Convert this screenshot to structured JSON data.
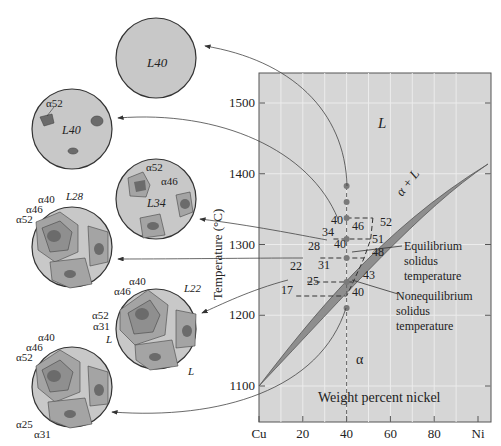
{
  "chart_data": {
    "type": "phase_diagram",
    "title": "",
    "xlabel": "Weight percent nickel",
    "ylabel": "Temperature (°C)",
    "x_ticks": [
      "Cu",
      "20",
      "40",
      "60",
      "80",
      "Ni"
    ],
    "x_tick_values": [
      0,
      20,
      40,
      60,
      80,
      100
    ],
    "y_ticks": [
      "1100",
      "1200",
      "1300",
      "1400",
      "1500"
    ],
    "y_tick_values": [
      1100,
      1200,
      1300,
      1400,
      1500
    ],
    "xlim": [
      0,
      100
    ],
    "ylim": [
      1060,
      1540
    ],
    "regions": {
      "liquid": "L",
      "two_phase": "α + L",
      "solid": "α"
    },
    "composition_line_x": 40,
    "cooling_points_temp": [
      1330,
      1300,
      1270,
      1240,
      1200,
      1150
    ],
    "tie_lines": [
      {
        "temp": 1280,
        "liquid_comp": 40,
        "solid_comp": 52,
        "avg_solid": null,
        "labels": [
          "40",
          "46",
          "52"
        ]
      },
      {
        "temp": 1260,
        "liquid_comp": 34,
        "solid_comp": 46,
        "avg_solid": 51,
        "labels": [
          "34",
          "46",
          "51"
        ]
      },
      {
        "temp": 1240,
        "liquid_comp": 28,
        "solid_comp": 40,
        "avg_solid": 48,
        "labels": [
          "28",
          "40",
          "48"
        ]
      },
      {
        "temp": 1200,
        "liquid_comp": 22,
        "solid_comp": 31,
        "avg_solid": 43,
        "labels": [
          "22",
          "31",
          "43"
        ]
      },
      {
        "temp": 1180,
        "liquid_comp": 17,
        "solid_comp": 25,
        "avg_solid": 40,
        "labels": [
          "17",
          "25",
          "40"
        ]
      }
    ],
    "annotations": [
      {
        "text": "Equilibrium solidus temperature",
        "lines": [
          "Equilibrium",
          "solidus",
          "temperature"
        ]
      },
      {
        "text": "Nonequilibrium solidus temperature",
        "lines": [
          "Nonequilibrium",
          "solidus",
          "temperature"
        ]
      }
    ]
  },
  "microstructures": [
    {
      "id": "m1",
      "labels": [
        "L40"
      ]
    },
    {
      "id": "m2",
      "labels": [
        "α52",
        "L40"
      ]
    },
    {
      "id": "m3",
      "labels": [
        "α52",
        "α46",
        "L34"
      ]
    },
    {
      "id": "m4",
      "labels": [
        "α40",
        "α46",
        "α52",
        "L28"
      ]
    },
    {
      "id": "m5",
      "labels": [
        "α40",
        "α46",
        "α52",
        "α31",
        "L",
        "L22",
        "L"
      ]
    },
    {
      "id": "m6",
      "labels": [
        "α40",
        "α46",
        "α52",
        "α25",
        "α31"
      ]
    }
  ],
  "colors": {
    "plot_bg": "#d6d6d6",
    "grid": "#ececec",
    "two_phase": "#8e8e8e",
    "liquid_circle": "#c8c8c8",
    "solid_outer": "#a4a4a4",
    "solid_mid": "#8f8f8f",
    "solid_core": "#6b6b6b",
    "dot": "#7a7a7a"
  }
}
